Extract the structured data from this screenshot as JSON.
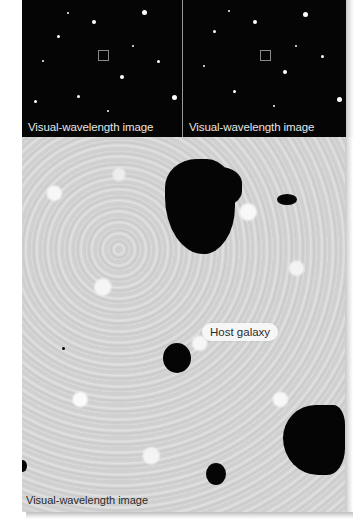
{
  "figure": {
    "top_left_panel": {
      "caption": "Visual-wavelength image",
      "marker": {
        "x": 76,
        "y": 50,
        "size": 9
      }
    },
    "top_right_panel": {
      "caption": "Visual-wavelength image",
      "marker": {
        "x": 77,
        "y": 50,
        "size": 9
      }
    },
    "bottom_panel": {
      "caption": "Visual-wavelength image",
      "label": "Host galaxy"
    }
  }
}
